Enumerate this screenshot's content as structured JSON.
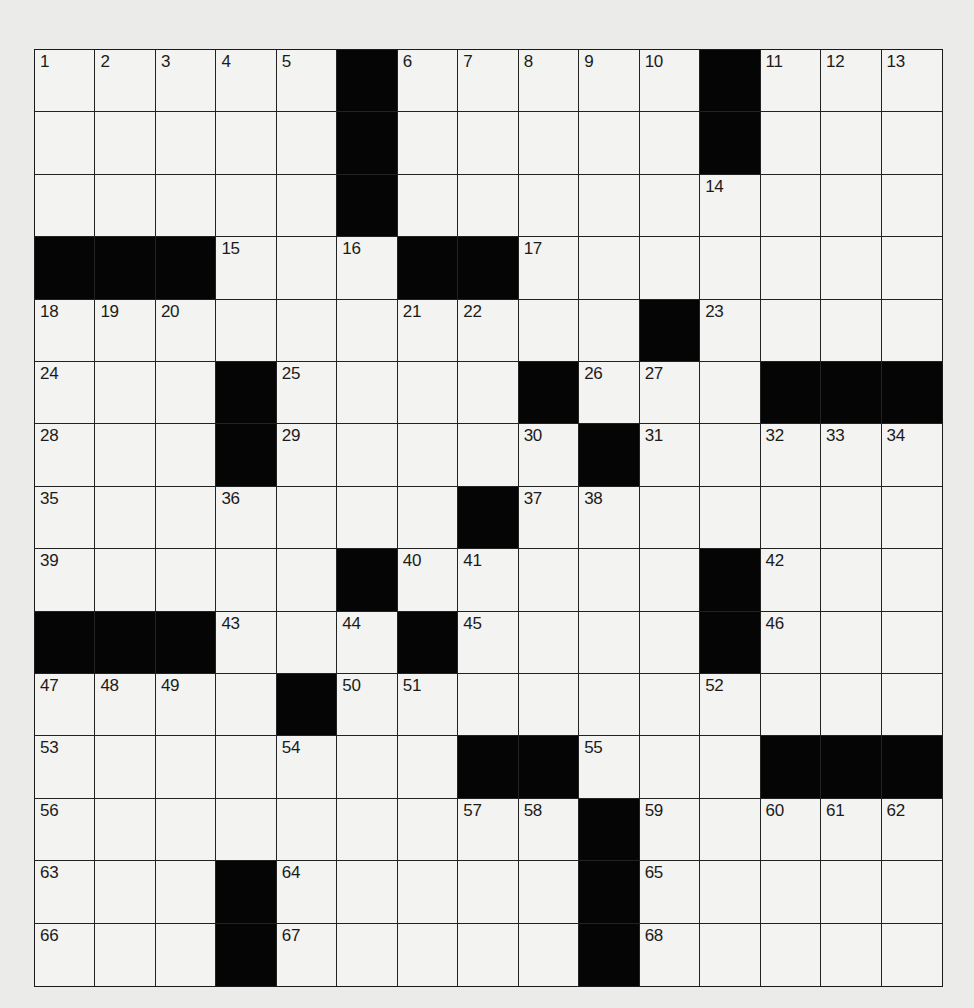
{
  "puzzle": {
    "rows": 15,
    "cols": 15,
    "colors": {
      "paper": "#ebebe9",
      "cell": "#f3f3f1",
      "block": "#050505",
      "line": "#222222",
      "number": "#1b1b1b"
    },
    "layout": [
      "NNNNN#NNNNN#NNN",
      ".....#.....#...",
      ".....#.....N...",
      "###N.N##N......",
      "NNN...NN..#N...",
      "N..#N...#NN.###",
      "N..#N...N#N.NNN",
      "N..N...#NN.....",
      "N....#NN...#N..",
      "###N.N#N...#N..",
      "NNN.#NN....N...",
      "N...N..##N..###",
      "N......NN#N.NNN",
      "N..#N....#N....",
      "N..#N....#N...."
    ],
    "numbers": [
      1,
      2,
      3,
      4,
      5,
      6,
      7,
      8,
      9,
      10,
      11,
      12,
      13,
      14,
      15,
      16,
      17,
      18,
      19,
      20,
      21,
      22,
      23,
      24,
      25,
      26,
      27,
      28,
      29,
      30,
      31,
      32,
      33,
      34,
      35,
      36,
      37,
      38,
      39,
      40,
      41,
      42,
      43,
      44,
      45,
      46,
      47,
      48,
      49,
      50,
      51,
      52,
      53,
      54,
      55,
      56,
      57,
      58,
      59,
      60,
      61,
      62,
      63,
      64,
      65,
      66,
      67,
      68,
      69,
      70,
      71,
      72,
      73
    ],
    "entries": {}
  }
}
